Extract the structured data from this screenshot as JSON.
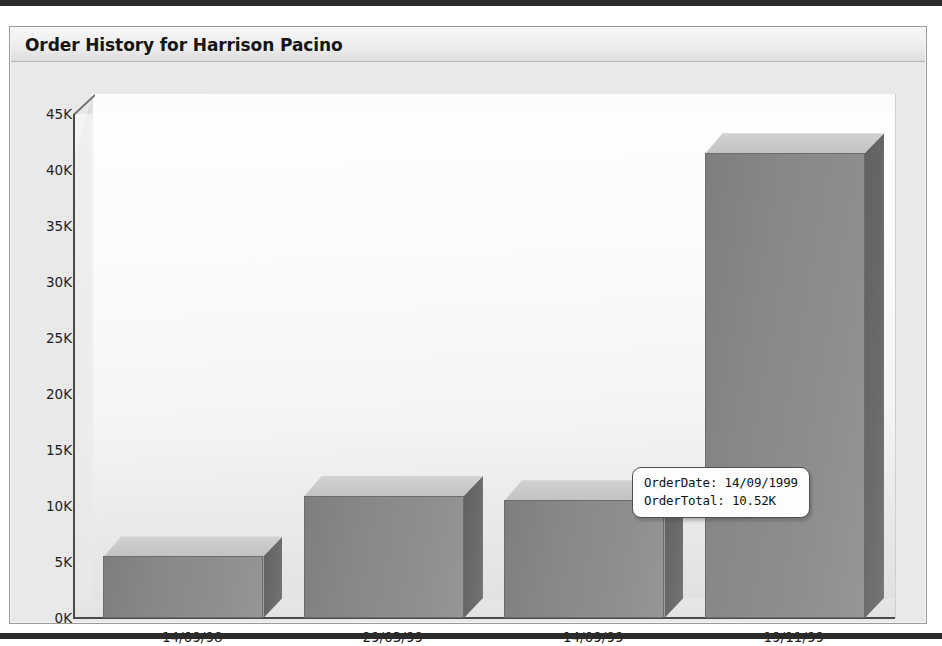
{
  "panel": {
    "title": "Order History for Harrison Pacino"
  },
  "chart_data": {
    "type": "bar",
    "title": "Order History for Harrison Pacino",
    "xlabel": "",
    "ylabel": "",
    "categories": [
      "14/09/98",
      "29/03/99",
      "14/09/99",
      "19/11/99"
    ],
    "values": [
      5.5,
      10.9,
      10.52,
      41.5
    ],
    "value_unit": "K",
    "ylim": [
      0,
      45
    ],
    "y_tick_values": [
      0,
      5,
      10,
      15,
      20,
      25,
      30,
      35,
      40,
      45
    ],
    "y_tick_labels": [
      "0K",
      "5K",
      "10K",
      "15K",
      "20K",
      "25K",
      "30K",
      "35K",
      "40K",
      "45K"
    ],
    "grid": false,
    "legend": false,
    "three_d": true,
    "series": [
      {
        "name": "OrderTotal",
        "values": [
          5.5,
          10.9,
          10.52,
          41.5
        ]
      }
    ],
    "annotations": [
      {
        "type": "tooltip",
        "target_category": "14/09/99",
        "lines": [
          "OrderDate: 14/09/1999",
          "OrderTotal: 10.52K"
        ]
      }
    ]
  },
  "tooltip": {
    "order_date_line": "OrderDate: 14/09/1999",
    "order_total_line": "OrderTotal: 10.52K"
  },
  "colors": {
    "bar_front": "#8a8a8a",
    "bar_top": "#c9c9c9",
    "bar_side": "#696969",
    "axis": "#4a4a4a",
    "title_text": "#161616",
    "panel_border": "#9a9a9a",
    "page_rule": "#2b2b2b",
    "tooltip_border": "#4f4f4f",
    "tooltip_background": "#fdfdfd"
  }
}
